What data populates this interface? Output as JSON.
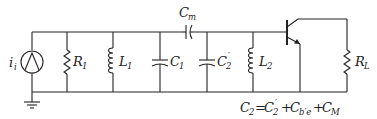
{
  "diagram": {
    "type": "circuit-schematic",
    "components": {
      "source": {
        "symbol": "i",
        "subscript": "i"
      },
      "r1": {
        "symbol": "R",
        "subscript": "1"
      },
      "l1": {
        "symbol": "L",
        "subscript": "1"
      },
      "c1": {
        "symbol": "C",
        "subscript": "1"
      },
      "cm": {
        "symbol": "C",
        "subscript": "m"
      },
      "c2p": {
        "symbol": "C",
        "subscript": "2",
        "prime": "′"
      },
      "l2": {
        "symbol": "L",
        "subscript": "2"
      },
      "rl": {
        "symbol": "R",
        "subscript": "L"
      }
    },
    "equation": {
      "lhs": "C",
      "lhs_sub": "2",
      "eq": "=",
      "t1": "C",
      "t1_sub": "2",
      "t1_prime": "′",
      "plus1": "+",
      "t2": "C",
      "t2_sub": "b′e",
      "plus2": "+",
      "t3": "C",
      "t3_sub": "M"
    }
  }
}
